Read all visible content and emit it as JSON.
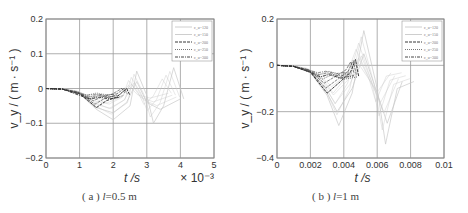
{
  "chart_data": [
    {
      "id": "a",
      "type": "line",
      "caption": "( a ) l=0.5 m",
      "caption_prefix": "( a )",
      "caption_var": "l",
      "caption_value": "=0.5 m",
      "xlabel": "t /s",
      "ylabel": "v_y / ( m · s⁻¹ )",
      "x_multiplier": "× 10⁻³",
      "xlim": [
        0,
        5
      ],
      "ylim": [
        -0.2,
        0.2
      ],
      "xticks": [
        "0",
        "1",
        "2",
        "3",
        "4",
        "5"
      ],
      "yticks": [
        "0.2",
        "0.1",
        "0",
        "−0.1",
        "−0.2"
      ],
      "grid": true,
      "legend_position": "upper right",
      "legend": [
        "c_u=120",
        "c_u=150",
        "c_u=200",
        "c_u=250",
        "c_u=300"
      ],
      "series": [
        {
          "name": "c_u=120",
          "style": "light-solid",
          "x": [
            0,
            0.5,
            1.0,
            1.5,
            2.0,
            2.5,
            2.7,
            3.0,
            3.2,
            3.5,
            3.8,
            4.1
          ],
          "y": [
            0,
            -0.002,
            -0.015,
            -0.06,
            -0.09,
            -0.05,
            0.05,
            -0.02,
            -0.1,
            -0.05,
            0.06,
            -0.03
          ]
        },
        {
          "name": "c_u=150",
          "style": "light-solid",
          "x": [
            0,
            0.5,
            1.0,
            1.5,
            2.0,
            2.4,
            2.7,
            3.0,
            3.4,
            4.0
          ],
          "y": [
            0,
            -0.002,
            -0.015,
            -0.055,
            -0.07,
            -0.04,
            0.02,
            -0.04,
            -0.06,
            -0.03
          ]
        },
        {
          "name": "c_u=200",
          "style": "dark-dashed",
          "x": [
            0,
            0.5,
            1.0,
            1.5,
            1.8,
            2.1,
            2.4,
            2.5
          ],
          "y": [
            0,
            -0.002,
            -0.015,
            -0.055,
            -0.035,
            -0.025,
            0.0,
            -0.02
          ]
        },
        {
          "name": "c_u=250",
          "style": "dark-dotted",
          "x": [
            0,
            0.5,
            1.0,
            1.3,
            1.6,
            2.0,
            2.3
          ],
          "y": [
            0,
            -0.002,
            -0.015,
            -0.03,
            -0.02,
            -0.03,
            -0.02
          ]
        },
        {
          "name": "c_u=300",
          "style": "dark-dashdot",
          "x": [
            0,
            0.5,
            1.0,
            1.3,
            1.6,
            1.9,
            2.2
          ],
          "y": [
            0,
            -0.002,
            -0.02,
            -0.03,
            -0.025,
            -0.03,
            -0.025
          ]
        }
      ]
    },
    {
      "id": "b",
      "type": "line",
      "caption": "( b ) l=1 m",
      "caption_prefix": "( b )",
      "caption_var": "l",
      "caption_value": "=1 m",
      "xlabel": "t /s",
      "ylabel": "v_y / ( m · s⁻¹ )",
      "x_multiplier": "",
      "xlim": [
        0,
        0.01
      ],
      "ylim": [
        -0.4,
        0.2
      ],
      "xticks": [
        "0",
        "0.002",
        "0.004",
        "0.006",
        "0.008",
        "0.01"
      ],
      "yticks": [
        "0.2",
        "0",
        "−0.2",
        "−0.4"
      ],
      "grid": true,
      "legend_position": "upper right",
      "legend": [
        "c_u=120",
        "c_u=150",
        "c_u=200",
        "c_u=250",
        "c_u=300"
      ],
      "series": [
        {
          "name": "c_u=120",
          "style": "light-solid",
          "x": [
            0,
            0.001,
            0.002,
            0.003,
            0.0037,
            0.0045,
            0.0052,
            0.006,
            0.0065,
            0.0072,
            0.0082
          ],
          "y": [
            0,
            -0.005,
            -0.03,
            -0.13,
            -0.26,
            -0.12,
            0.15,
            -0.1,
            -0.34,
            -0.1,
            -0.07
          ]
        },
        {
          "name": "c_u=150",
          "style": "light-solid",
          "x": [
            0,
            0.001,
            0.002,
            0.003,
            0.0036,
            0.0045,
            0.0052,
            0.006,
            0.0066,
            0.0075
          ],
          "y": [
            0,
            -0.005,
            -0.03,
            -0.12,
            -0.2,
            -0.1,
            0.05,
            -0.12,
            -0.25,
            -0.07
          ]
        },
        {
          "name": "c_u=200",
          "style": "dark-dashed",
          "x": [
            0,
            0.001,
            0.002,
            0.003,
            0.0038,
            0.0044,
            0.0047,
            0.0049
          ],
          "y": [
            0,
            -0.005,
            -0.03,
            -0.12,
            -0.07,
            -0.03,
            0.025,
            -0.05
          ]
        },
        {
          "name": "c_u=250",
          "style": "dark-dotted",
          "x": [
            0,
            0.001,
            0.002,
            0.0027,
            0.0033,
            0.004,
            0.0048
          ],
          "y": [
            0,
            -0.005,
            -0.03,
            -0.06,
            -0.04,
            -0.06,
            -0.05
          ]
        },
        {
          "name": "c_u=300",
          "style": "dark-dashdot",
          "x": [
            0,
            0.001,
            0.002,
            0.0026,
            0.0031,
            0.0038,
            0.0046
          ],
          "y": [
            0,
            -0.005,
            -0.03,
            -0.05,
            -0.04,
            -0.055,
            -0.045
          ]
        }
      ]
    }
  ]
}
